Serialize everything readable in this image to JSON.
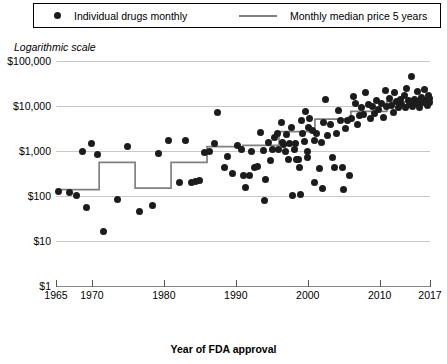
{
  "legend": {
    "items": [
      {
        "key": "points",
        "label": "Individual drugs monthly",
        "marker": "filled-circle",
        "color": "#1a1a1a"
      },
      {
        "key": "line",
        "label": "Monthly median price 5 years",
        "marker": "line-segment",
        "color": "#808080"
      }
    ]
  },
  "notes": {
    "scale_note": "Logarithmic scale"
  },
  "axes": {
    "x_title": "Year of FDA approval",
    "x_ticks": [
      "1965",
      "1970",
      "1980",
      "1990",
      "2000",
      "2010",
      "2017"
    ],
    "y_ticks": [
      "$100,000",
      "$10,000",
      "$1,000",
      "$100",
      "$10",
      "$1"
    ]
  },
  "chart_data": {
    "type": "scatter",
    "title": "",
    "subtitle": "Logarithmic scale",
    "xlabel": "Year of FDA approval",
    "ylabel": "",
    "xlim": [
      1965,
      2017
    ],
    "ylim": [
      1,
      100000
    ],
    "yscale": "log",
    "grid": true,
    "legend_position": "top",
    "xticks": [
      1965,
      1970,
      1980,
      1990,
      2000,
      2010,
      2017
    ],
    "ytick_values": [
      1,
      10,
      100,
      1000,
      10000,
      100000
    ],
    "ytick_labels": [
      "$1",
      "$10",
      "$100",
      "$1,000",
      "$10,000",
      "$100,000"
    ],
    "series": [
      {
        "name": "Individual drugs monthly",
        "type": "scatter",
        "color": "#1c1c1c",
        "points": [
          [
            1965.4,
            128
          ],
          [
            1966.9,
            122
          ],
          [
            1967.8,
            104
          ],
          [
            1968.7,
            1000
          ],
          [
            1969.3,
            55
          ],
          [
            1969.9,
            1480
          ],
          [
            1970.8,
            840
          ],
          [
            1971.6,
            16
          ],
          [
            1973.5,
            84
          ],
          [
            1974.9,
            1290
          ],
          [
            1976.6,
            46
          ],
          [
            1978.4,
            62
          ],
          [
            1979.3,
            900
          ],
          [
            1980.6,
            1690
          ],
          [
            1982.2,
            200
          ],
          [
            1983.0,
            1730
          ],
          [
            1983.8,
            200
          ],
          [
            1984.4,
            208
          ],
          [
            1985.0,
            222
          ],
          [
            1985.6,
            920
          ],
          [
            1986.3,
            1000
          ],
          [
            1987.0,
            1440
          ],
          [
            1987.5,
            7000
          ],
          [
            1988.4,
            420
          ],
          [
            1988.9,
            740
          ],
          [
            1989.6,
            310
          ],
          [
            1990.3,
            1310
          ],
          [
            1990.8,
            1080
          ],
          [
            1991.0,
            280
          ],
          [
            1991.4,
            154
          ],
          [
            1991.9,
            285
          ],
          [
            1992.2,
            1000
          ],
          [
            1992.6,
            440
          ],
          [
            1993.0,
            460
          ],
          [
            1993.5,
            2600
          ],
          [
            1993.8,
            1020
          ],
          [
            1994.1,
            230
          ],
          [
            1994.5,
            1540
          ],
          [
            1994.8,
            620
          ],
          [
            1995.1,
            1090
          ],
          [
            1995.4,
            2000
          ],
          [
            1995.8,
            2500
          ],
          [
            1996.0,
            1080
          ],
          [
            1996.3,
            4200
          ],
          [
            1996.5,
            1520
          ],
          [
            1996.7,
            1400
          ],
          [
            1996.9,
            960
          ],
          [
            1997.1,
            2300
          ],
          [
            1997.3,
            660
          ],
          [
            1997.5,
            1480
          ],
          [
            1997.7,
            3400
          ],
          [
            1997.9,
            104
          ],
          [
            1998.1,
            1100
          ],
          [
            1998.3,
            1460
          ],
          [
            1998.5,
            660
          ],
          [
            1998.7,
            650
          ],
          [
            1998.9,
            430
          ],
          [
            1999.1,
            4700
          ],
          [
            1999.3,
            2400
          ],
          [
            1999.5,
            1650
          ],
          [
            1999.7,
            7400
          ],
          [
            1999.9,
            1000
          ],
          [
            2000.1,
            3300
          ],
          [
            2000.3,
            5400
          ],
          [
            2000.6,
            2800
          ],
          [
            2000.9,
            1680
          ],
          [
            2001.2,
            2400
          ],
          [
            2001.6,
            400
          ],
          [
            2001.9,
            1560
          ],
          [
            2002.2,
            4200
          ],
          [
            2002.5,
            14000
          ],
          [
            2002.8,
            2200
          ],
          [
            2003.1,
            3900
          ],
          [
            2003.4,
            700
          ],
          [
            2003.7,
            420
          ],
          [
            2004.0,
            2400
          ],
          [
            2004.3,
            7800
          ],
          [
            2004.6,
            4800
          ],
          [
            2004.9,
            420
          ],
          [
            2005.2,
            3200
          ],
          [
            2005.5,
            4700
          ],
          [
            2005.8,
            290
          ],
          [
            2006.1,
            5200
          ],
          [
            2006.4,
            16000
          ],
          [
            2006.7,
            11500
          ],
          [
            2006.9,
            3900
          ],
          [
            2007.2,
            6200
          ],
          [
            2007.5,
            9200
          ],
          [
            2007.8,
            6600
          ],
          [
            2008.1,
            20000
          ],
          [
            2008.4,
            11000
          ],
          [
            2008.7,
            5200
          ],
          [
            2009.0,
            9800
          ],
          [
            2009.3,
            6700
          ],
          [
            2009.6,
            13500
          ],
          [
            2009.9,
            8400
          ],
          [
            2010.2,
            11200
          ],
          [
            2010.5,
            5500
          ],
          [
            2010.8,
            22000
          ],
          [
            2011.0,
            9800
          ],
          [
            2011.3,
            14500
          ],
          [
            2011.6,
            10500
          ],
          [
            2011.9,
            7200
          ],
          [
            2012.1,
            20000
          ],
          [
            2012.4,
            12500
          ],
          [
            2012.6,
            9400
          ],
          [
            2012.9,
            13800
          ],
          [
            2013.1,
            11000
          ],
          [
            2013.4,
            17500
          ],
          [
            2013.6,
            9200
          ],
          [
            2013.8,
            24000
          ],
          [
            2014.0,
            13000
          ],
          [
            2014.2,
            10800
          ],
          [
            2014.4,
            45000
          ],
          [
            2014.6,
            9600
          ],
          [
            2014.8,
            14200
          ],
          [
            2015.0,
            11500
          ],
          [
            2015.2,
            20500
          ],
          [
            2015.4,
            12800
          ],
          [
            2015.6,
            9400
          ],
          [
            2015.8,
            15800
          ],
          [
            2016.0,
            11800
          ],
          [
            2016.2,
            23000
          ],
          [
            2016.4,
            13500
          ],
          [
            2016.6,
            10500
          ],
          [
            2016.8,
            17000
          ],
          [
            2016.9,
            12000
          ],
          [
            2016.95,
            14500
          ],
          [
            1999.0,
            108
          ],
          [
            2001.0,
            200
          ],
          [
            2002.0,
            145
          ],
          [
            1994.0,
            80
          ],
          [
            2000.0,
            700
          ],
          [
            2005.0,
            140
          ]
        ]
      },
      {
        "name": "Monthly median price 5 years",
        "type": "step",
        "color": "#808080",
        "steps": [
          {
            "x_start": 1965,
            "x_end": 1971,
            "value": 138
          },
          {
            "x_start": 1971,
            "x_end": 1976,
            "value": 560
          },
          {
            "x_start": 1976,
            "x_end": 1981,
            "value": 150
          },
          {
            "x_start": 1981,
            "x_end": 1986,
            "value": 560
          },
          {
            "x_start": 1986,
            "x_end": 1991,
            "value": 1250
          },
          {
            "x_start": 1991,
            "x_end": 1996,
            "value": 1330
          },
          {
            "x_start": 1996,
            "x_end": 2001,
            "value": 2700
          },
          {
            "x_start": 2001,
            "x_end": 2006,
            "value": 5100
          },
          {
            "x_start": 2006,
            "x_end": 2011,
            "value": 7600
          },
          {
            "x_start": 2011,
            "x_end": 2017,
            "value": 12500
          }
        ]
      }
    ]
  }
}
